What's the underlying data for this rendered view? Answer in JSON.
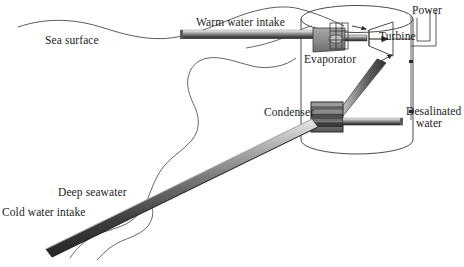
{
  "diagram": {
    "type": "engineering-schematic",
    "canvas": {
      "width": 464,
      "height": 267
    },
    "colors": {
      "line": "#3a3a3a",
      "wave": "#4a4a4a",
      "pipe_light": "#d8d8d8",
      "pipe_mid": "#8c8c8c",
      "pipe_dark": "#2e2e2e",
      "equipment_fill": "#8f8f8f",
      "condenser_dark": "#3c3c3c",
      "background": "#ffffff",
      "text": "#1b1b1b"
    },
    "labels": {
      "sea_surface": "Sea surface",
      "warm_water_intake": "Warm water intake",
      "evaporator": "Evaporator",
      "turbine": "Turbine",
      "power": "Power",
      "condenser": "Condenser",
      "desalinated_line1": "Desalinated",
      "desalinated_line2": "water",
      "deep_seawater": "Deep seawater",
      "cold_water_intake": "Cold water intake"
    },
    "components": [
      {
        "name": "sea-surface-wave",
        "kind": "wavy-line",
        "label": "Sea surface"
      },
      {
        "name": "thermocline-wave",
        "kind": "wavy-line",
        "label": ""
      },
      {
        "name": "warm-water-intake-pipe",
        "kind": "horizontal-pipe",
        "label": "Warm water intake"
      },
      {
        "name": "plant-vessel",
        "kind": "cylinder",
        "label": ""
      },
      {
        "name": "evaporator-unit",
        "kind": "block-with-coil",
        "label": "Evaporator"
      },
      {
        "name": "turbine-unit",
        "kind": "funnel",
        "label": "Turbine"
      },
      {
        "name": "power-lines",
        "kind": "wires",
        "label": "Power"
      },
      {
        "name": "condenser-unit",
        "kind": "banded-box",
        "label": "Condenser"
      },
      {
        "name": "vapor-return-pipe",
        "kind": "diagonal-pipe",
        "label": ""
      },
      {
        "name": "desalinated-water-pipe",
        "kind": "horizontal-pipe",
        "label": "Desalinated water"
      },
      {
        "name": "cold-water-intake-pipe",
        "kind": "diagonal-pipe",
        "label": "Cold water intake / Deep seawater"
      }
    ],
    "flow_arrows": [
      {
        "name": "vapor-to-turbine-arrow",
        "direction": "right"
      },
      {
        "name": "turbine-exit-arrow",
        "direction": "right"
      },
      {
        "name": "vapor-return-arrow",
        "direction": "up-right"
      }
    ]
  }
}
